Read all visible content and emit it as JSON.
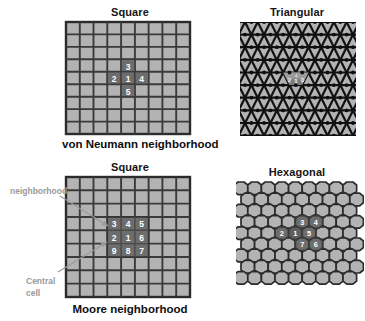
{
  "figure": {
    "background_color": "#ffffff",
    "cell_fill": "#b3b3b3",
    "cell_stroke": "#2b2b2b",
    "highlight_fill": "#6d6d6d",
    "highlight_stroke": "#3a3a3a",
    "highlight_text_color": "#ffffff",
    "annotation_color": "#9a9a9a"
  },
  "panels": {
    "square_von_neumann": {
      "title": "Square",
      "caption": "von Neumann neighborhood",
      "grid": {
        "cols": 9,
        "rows": 9
      },
      "neighborhood": {
        "type": "von Neumann",
        "cells": [
          {
            "label": "3",
            "col": 4,
            "row": 3
          },
          {
            "label": "2",
            "col": 3,
            "row": 4
          },
          {
            "label": "1",
            "col": 4,
            "row": 4
          },
          {
            "label": "4",
            "col": 5,
            "row": 4
          },
          {
            "label": "5",
            "col": 4,
            "row": 5
          }
        ]
      }
    },
    "triangular": {
      "title": "Triangular",
      "caption": "",
      "grid": {
        "cols": 9,
        "rows": 9
      },
      "neighborhood": {
        "type": "triangular",
        "cells": [
          {
            "label": "2"
          },
          {
            "label": "1"
          },
          {
            "label": "3"
          },
          {
            "label": "4"
          }
        ]
      }
    },
    "square_moore": {
      "title": "Square",
      "caption": "Moore neighborhood",
      "grid": {
        "cols": 9,
        "rows": 9
      },
      "neighborhood": {
        "type": "Moore",
        "rows": [
          [
            "3",
            "4",
            "5"
          ],
          [
            "2",
            "1",
            "6"
          ],
          [
            "9",
            "8",
            "7"
          ]
        ],
        "origin": {
          "col": 3,
          "row": 3
        }
      },
      "annotations": {
        "neighborhood_label": "neighborhood",
        "central_cell_label_line1": "Central",
        "central_cell_label_line2": "cell"
      }
    },
    "hexagonal": {
      "title": "Hexagonal",
      "caption": "",
      "grid": {
        "cols": 8,
        "rows": 9
      },
      "neighborhood": {
        "type": "hexagonal",
        "cells": [
          {
            "label": "3",
            "ring_pos": "upper-left"
          },
          {
            "label": "4",
            "ring_pos": "upper-right"
          },
          {
            "label": "2",
            "ring_pos": "left"
          },
          {
            "label": "1",
            "ring_pos": "center"
          },
          {
            "label": "5",
            "ring_pos": "right"
          },
          {
            "label": "7",
            "ring_pos": "lower-left"
          },
          {
            "label": "6",
            "ring_pos": "lower-right"
          }
        ]
      }
    }
  }
}
